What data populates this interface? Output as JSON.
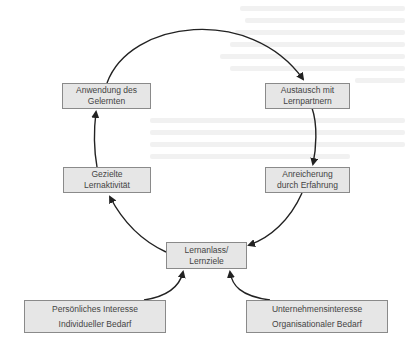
{
  "diagram": {
    "type": "learning-cycle",
    "colors": {
      "box_fill": "#e6e6e6",
      "box_border": "#8a8a8a",
      "text": "#444444",
      "arrow": "#222222"
    },
    "cycle_nodes": [
      {
        "id": "anwendung",
        "line1": "Anwendung des",
        "line2": "Gelernten"
      },
      {
        "id": "austausch",
        "line1": "Austausch mit",
        "line2": "Lernpartnern"
      },
      {
        "id": "anreicherung",
        "line1": "Anreicherung",
        "line2": "durch Erfahrung"
      },
      {
        "id": "lernanlass",
        "line1": "Lernanlass/",
        "line2": "Lernziele"
      },
      {
        "id": "lernaktivitaet",
        "line1": "Gezielte",
        "line2": "Lernaktivität"
      }
    ],
    "input_nodes": [
      {
        "id": "persoenlich",
        "line1": "Persönliches Interesse",
        "line2": "Individueller Bedarf"
      },
      {
        "id": "unternehmen",
        "line1": "Unternehmensinteresse",
        "line2": "Organisationaler Bedarf"
      }
    ],
    "edges": [
      {
        "from": "anwendung",
        "to": "austausch"
      },
      {
        "from": "austausch",
        "to": "anreicherung"
      },
      {
        "from": "anreicherung",
        "to": "lernanlass"
      },
      {
        "from": "lernanlass",
        "to": "lernaktivitaet"
      },
      {
        "from": "lernaktivitaet",
        "to": "anwendung"
      },
      {
        "from": "persoenlich",
        "to": "lernanlass"
      },
      {
        "from": "unternehmen",
        "to": "lernanlass"
      }
    ]
  }
}
